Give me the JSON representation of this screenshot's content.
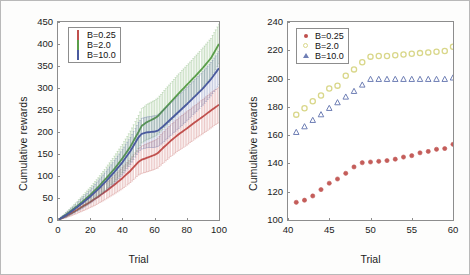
{
  "figure": {
    "panels": [
      "left",
      "right"
    ],
    "colors": {
      "b025": "#c0504d",
      "b20": "#5a9e4a",
      "b20_right": "#d9d78a",
      "b100": "#4a5a9e",
      "b100_right": "#6f7fb5",
      "axis": "#8d8d8d",
      "text": "#1b1b1b",
      "background": "#fdfdfc"
    }
  },
  "chart_data": [
    {
      "type": "line",
      "panel": "left",
      "title": "",
      "xlabel": "Trial",
      "ylabel": "Cumulative rewards",
      "xlim": [
        0,
        100
      ],
      "ylim": [
        0,
        450
      ],
      "xticks": [
        0,
        20,
        40,
        60,
        80,
        100
      ],
      "yticks": [
        0,
        50,
        100,
        150,
        200,
        250,
        300,
        350,
        400,
        450
      ],
      "grid": false,
      "errorbars": true,
      "legend_position": "upper-left",
      "legend": [
        "B=0.25",
        "B=2.0",
        "B=10.0"
      ],
      "x": [
        0,
        5,
        10,
        15,
        20,
        25,
        30,
        35,
        40,
        45,
        50,
        52,
        55,
        60,
        62,
        65,
        70,
        75,
        80,
        85,
        90,
        95,
        100
      ],
      "series": [
        {
          "name": "B=0.25",
          "color": "#c0504d",
          "values": [
            0,
            9,
            19,
            30,
            41,
            53,
            66,
            80,
            95,
            112,
            132,
            137,
            141,
            148,
            152,
            163,
            180,
            195,
            208,
            222,
            235,
            249,
            262
          ],
          "err": [
            0,
            4,
            7,
            10,
            13,
            16,
            18,
            21,
            24,
            27,
            30,
            31,
            32,
            33,
            34,
            35,
            36,
            37,
            38,
            38,
            39,
            40,
            40
          ]
        },
        {
          "name": "B=2.0",
          "color": "#5a9e4a",
          "values": [
            0,
            12,
            26,
            41,
            57,
            75,
            95,
            116,
            140,
            167,
            200,
            214,
            222,
            231,
            236,
            248,
            268,
            288,
            307,
            326,
            346,
            368,
            400
          ],
          "err": [
            0,
            5,
            9,
            13,
            17,
            21,
            25,
            29,
            32,
            35,
            38,
            39,
            40,
            41,
            41,
            42,
            43,
            44,
            44,
            45,
            45,
            45,
            45
          ]
        },
        {
          "name": "B=10.0",
          "color": "#4a5a9e",
          "values": [
            0,
            11,
            24,
            38,
            53,
            70,
            89,
            109,
            131,
            157,
            188,
            196,
            199,
            201,
            203,
            212,
            229,
            246,
            263,
            281,
            299,
            320,
            345
          ],
          "err": [
            0,
            5,
            8,
            12,
            15,
            19,
            22,
            26,
            29,
            31,
            34,
            35,
            35,
            36,
            36,
            37,
            37,
            38,
            38,
            38,
            38,
            38,
            38
          ]
        }
      ]
    },
    {
      "type": "scatter",
      "panel": "right",
      "title": "",
      "xlabel": "Trial",
      "ylabel": "Cumulative rewards",
      "xlim": [
        40,
        60
      ],
      "ylim": [
        100,
        240
      ],
      "xticks": [
        40,
        45,
        50,
        55,
        60
      ],
      "yticks": [
        100,
        120,
        140,
        160,
        180,
        200,
        220,
        240
      ],
      "grid": false,
      "errorbars": false,
      "legend_position": "upper-left",
      "legend": [
        "B=0.25",
        "B=2.0",
        "B=10.0"
      ],
      "x": [
        41,
        42,
        43,
        44,
        45,
        46,
        47,
        48,
        49,
        50,
        51,
        52,
        53,
        54,
        55,
        56,
        57,
        58,
        59,
        60
      ],
      "series": [
        {
          "name": "B=0.25",
          "color": "#c0504d",
          "marker": "filled-circle",
          "values": [
            112.5,
            114,
            117,
            121.5,
            126,
            129,
            133,
            137.5,
            140.5,
            141,
            141.5,
            142,
            143,
            144.5,
            145.5,
            147.5,
            148.5,
            150,
            150.5,
            153.5
          ]
        },
        {
          "name": "B=2.0",
          "color": "#d9d78a",
          "marker": "open-circle",
          "values": [
            174.5,
            179,
            184,
            188,
            193,
            195,
            202,
            206.5,
            211.5,
            215.5,
            216,
            216,
            216.5,
            217,
            217.5,
            218,
            218.5,
            219,
            219.5,
            222.5
          ]
        },
        {
          "name": "B=10.0",
          "color": "#6f7fb5",
          "marker": "open-triangle",
          "values": [
            162,
            166,
            170.5,
            174.5,
            179,
            183,
            187,
            191,
            195.5,
            199.5,
            199.5,
            199.5,
            199.5,
            199.5,
            199.5,
            199.5,
            199.5,
            199.5,
            199.5,
            200.5
          ]
        }
      ]
    }
  ],
  "left_panel": {
    "ylabel": "Cumulative rewards",
    "xlabel": "Trial",
    "yticks": [
      "450",
      "400",
      "350",
      "300",
      "250",
      "200",
      "150",
      "100",
      "50",
      "0"
    ],
    "xticks": [
      "0",
      "20",
      "40",
      "60",
      "80",
      "100"
    ],
    "legend": [
      {
        "label": "B=0.25",
        "key": "errorbar-red"
      },
      {
        "label": "B=2.0",
        "key": "errorbar-green"
      },
      {
        "label": "B=10.0",
        "key": "errorbar-blue"
      }
    ]
  },
  "right_panel": {
    "ylabel": "Cumulative rewards",
    "xlabel": "Trial",
    "yticks": [
      "240",
      "220",
      "200",
      "180",
      "160",
      "140",
      "120",
      "100"
    ],
    "xticks": [
      "40",
      "45",
      "50",
      "55",
      "60"
    ],
    "legend": [
      {
        "label": "B=0.25",
        "key": "dot-red"
      },
      {
        "label": "B=2.0",
        "key": "circle-yellow"
      },
      {
        "label": "B=10.0",
        "key": "triangle-blue"
      }
    ]
  }
}
